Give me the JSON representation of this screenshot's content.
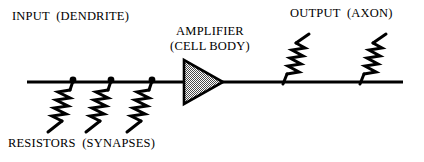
{
  "figure": {
    "title_text_present": false,
    "background_color": "#ffffff",
    "ink_color": "#000000",
    "amplifier_fill_color": "#9a9a9a"
  },
  "labels": {
    "input": "INPUT  (DENDRITE)",
    "amplifier_line1": "AMPLIFIER",
    "amplifier_line2": "(CELL BODY)",
    "output": "OUTPUT  (AXON)",
    "resistors": "RESISTORS  (SYNAPSES)"
  },
  "diagram": {
    "input_line": {
      "name": "dendrite-line",
      "x1": 27,
      "y1": 82,
      "x2": 186,
      "y2": 82
    },
    "output_line": {
      "name": "axon-line",
      "x1": 222,
      "y1": 82,
      "x2": 403,
      "y2": 82
    },
    "amplifier": {
      "name": "amplifier-triangle",
      "apex_x": 223,
      "apex_y": 82,
      "back_x": 184,
      "top_y": 60,
      "bottom_y": 104
    },
    "input_junction_dots": [
      {
        "cx": 73,
        "cy": 81,
        "r": 3.2
      },
      {
        "cx": 111,
        "cy": 81,
        "r": 3.2
      },
      {
        "cx": 152,
        "cy": 81,
        "r": 3.2
      }
    ],
    "input_resistors": [
      {
        "name": "synapse-resistor-1",
        "top_x": 73,
        "top_y": 81,
        "bottom_x": 48,
        "bottom_y": 132
      },
      {
        "name": "synapse-resistor-2",
        "top_x": 111,
        "top_y": 81,
        "bottom_x": 86,
        "bottom_y": 132
      },
      {
        "name": "synapse-resistor-3",
        "top_x": 152,
        "top_y": 81,
        "bottom_x": 127,
        "bottom_y": 132
      }
    ],
    "output_resistors": [
      {
        "name": "axon-resistor-1",
        "bottom_x": 283,
        "bottom_y": 84,
        "top_x": 309,
        "top_y": 34
      },
      {
        "name": "axon-resistor-2",
        "bottom_x": 360,
        "bottom_y": 84,
        "top_x": 386,
        "top_y": 34
      }
    ]
  },
  "label_positions": {
    "input": {
      "left": 12,
      "top": 9
    },
    "amplifier": {
      "left": 155,
      "top": 24
    },
    "output": {
      "left": 290,
      "top": 6
    },
    "resistors": {
      "left": 8,
      "top": 136
    }
  }
}
